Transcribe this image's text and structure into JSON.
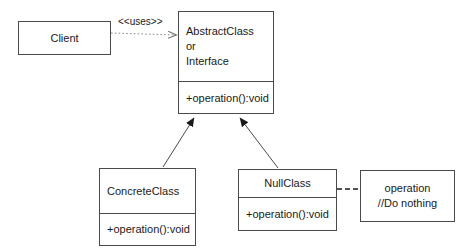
{
  "diagram": {
    "type": "uml-class-diagram",
    "nodes": [
      {
        "id": "client",
        "name": "Client",
        "kind": "class",
        "align": "center",
        "x": 18,
        "y": 21,
        "w": 93,
        "h": 34,
        "header_lines": [
          "Client"
        ],
        "members": []
      },
      {
        "id": "abstract",
        "name": "AbstractClass or Interface",
        "kind": "abstract-class",
        "align": "left",
        "x": 178,
        "y": 11,
        "w": 96,
        "h": 103,
        "header_lines": [
          "AbstractClass",
          "or",
          "Interface"
        ],
        "members": [
          "+operation():void"
        ]
      },
      {
        "id": "concrete",
        "name": "ConcreteClass",
        "kind": "class",
        "align": "left",
        "x": 99,
        "y": 168,
        "w": 97,
        "h": 78,
        "header_lines": [
          "ConcreteClass"
        ],
        "members": [
          "+operation():void"
        ]
      },
      {
        "id": "nullclass",
        "name": "NullClass",
        "kind": "class",
        "align": "center",
        "x": 238,
        "y": 169,
        "w": 99,
        "h": 62,
        "header_lines": [
          "NullClass"
        ],
        "members": [
          "+operation():void"
        ]
      },
      {
        "id": "note",
        "name": "operation note",
        "kind": "note",
        "align": "center",
        "x": 360,
        "y": 170,
        "w": 95,
        "h": 52,
        "header_lines": [
          "operation",
          "//Do nothing"
        ],
        "members": []
      }
    ],
    "edges": [
      {
        "id": "uses",
        "from": "client",
        "to": "abstract",
        "kind": "dependency",
        "line": "dotted",
        "arrow": "open",
        "label": "<<uses>>",
        "label_x": 118,
        "label_y": 16
      },
      {
        "id": "concrete-inherits",
        "from": "concrete",
        "to": "abstract",
        "kind": "generalization",
        "line": "solid",
        "arrow": "filled-triangle",
        "label": ""
      },
      {
        "id": "null-inherits",
        "from": "nullclass",
        "to": "abstract",
        "kind": "generalization",
        "line": "solid",
        "arrow": "filled-triangle",
        "label": ""
      },
      {
        "id": "note-link",
        "from": "nullclass",
        "to": "note",
        "kind": "note-anchor",
        "line": "dashed",
        "arrow": "none",
        "label": ""
      }
    ],
    "colors": {
      "stroke": "#4a4a4a",
      "text": "#1a1a1a",
      "background": "#ffffff"
    }
  }
}
